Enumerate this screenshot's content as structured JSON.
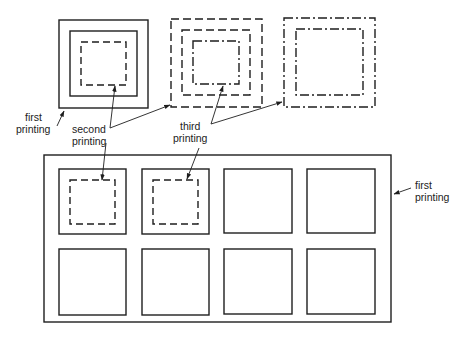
{
  "diagram": {
    "type": "printing-registration-diagram",
    "colors": {
      "line": "#1e1e1e",
      "background": "#ffffff"
    },
    "labels": {
      "first_printing_top": [
        "first",
        "printing"
      ],
      "second_printing": [
        "second",
        "printing"
      ],
      "third_printing": [
        "third",
        "printing"
      ],
      "first_printing_sheet": [
        "first",
        "printing"
      ]
    },
    "top_row": [
      {
        "name": "example-1",
        "layers": [
          "first printing (solid)",
          "first printing (solid)",
          "second printing (dashed)"
        ]
      },
      {
        "name": "example-2",
        "layers": [
          "second printing (dashed)",
          "second printing (dashed)",
          "third printing (dash-dot)"
        ]
      },
      {
        "name": "example-3",
        "layers": [
          "third printing (dash-dot)",
          "third printing (dash-dot)"
        ]
      }
    ],
    "sheet": {
      "rows": 2,
      "cols": 4,
      "cells_with_second_printing": [
        0,
        1
      ]
    }
  }
}
